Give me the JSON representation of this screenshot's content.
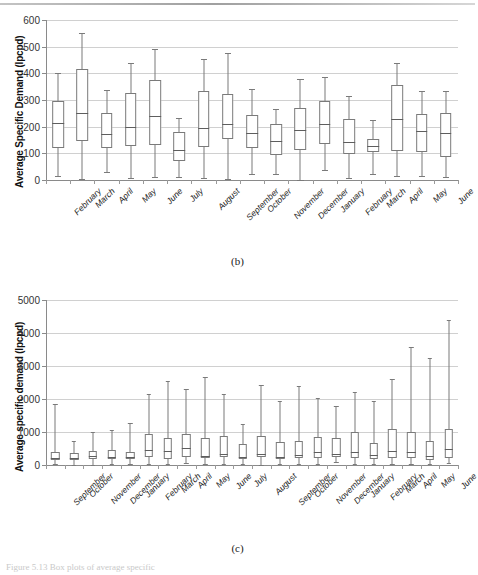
{
  "document": {
    "page_caption": "Figure 5.13 Box plots of average specific",
    "panel_b_label": "(b)",
    "panel_c_label": "(c)"
  },
  "chart_data": [
    {
      "id": "panel-b",
      "type": "box",
      "title": "",
      "panel": "(b)",
      "xlabel": "",
      "ylabel": "Average Specific Demand (lpcpd)",
      "ylim": [
        0,
        600
      ],
      "yticks": [
        0,
        100,
        200,
        300,
        400,
        500,
        600
      ],
      "grid": true,
      "legend": "none",
      "categories": [
        "February",
        "March",
        "April",
        "May",
        "June",
        "July",
        "August",
        "September",
        "October",
        "November",
        "December",
        "January",
        "February",
        "March",
        "April",
        "May",
        "June"
      ],
      "boxes": [
        {
          "category": "February",
          "min": 15,
          "q1": 120,
          "median": 212,
          "q3": 295,
          "max": 400
        },
        {
          "category": "March",
          "min": 5,
          "q1": 148,
          "median": 250,
          "q3": 418,
          "max": 553
        },
        {
          "category": "April",
          "min": 30,
          "q1": 120,
          "median": 174,
          "q3": 250,
          "max": 338
        },
        {
          "category": "May",
          "min": 8,
          "q1": 128,
          "median": 197,
          "q3": 326,
          "max": 440
        },
        {
          "category": "June",
          "min": 12,
          "q1": 130,
          "median": 241,
          "q3": 374,
          "max": 492
        },
        {
          "category": "July",
          "min": 10,
          "q1": 72,
          "median": 111,
          "q3": 180,
          "max": 234
        },
        {
          "category": "August",
          "min": 8,
          "q1": 125,
          "median": 195,
          "q3": 335,
          "max": 452
        },
        {
          "category": "September",
          "min": 2,
          "q1": 152,
          "median": 210,
          "q3": 321,
          "max": 476
        },
        {
          "category": "October",
          "min": 24,
          "q1": 120,
          "median": 175,
          "q3": 245,
          "max": 340
        },
        {
          "category": "November",
          "min": 22,
          "q1": 93,
          "median": 147,
          "q3": 210,
          "max": 265
        },
        {
          "category": "December",
          "min": 0,
          "q1": 112,
          "median": 186,
          "q3": 270,
          "max": 378
        },
        {
          "category": "January",
          "min": 38,
          "q1": 135,
          "median": 210,
          "q3": 295,
          "max": 386
        },
        {
          "category": "February",
          "min": 8,
          "q1": 96,
          "median": 143,
          "q3": 228,
          "max": 316
        },
        {
          "category": "March",
          "min": 24,
          "q1": 106,
          "median": 127,
          "q3": 155,
          "max": 226
        },
        {
          "category": "April",
          "min": 14,
          "q1": 110,
          "median": 228,
          "q3": 357,
          "max": 438
        },
        {
          "category": "May",
          "min": 14,
          "q1": 106,
          "median": 185,
          "q3": 246,
          "max": 333
        },
        {
          "category": "June",
          "min": 10,
          "q1": 88,
          "median": 176,
          "q3": 250,
          "max": 332
        }
      ]
    },
    {
      "id": "panel-c",
      "type": "box",
      "title": "",
      "panel": "(c)",
      "xlabel": "",
      "ylabel": "Average specific demand (lpcpd)",
      "ylim": [
        0,
        5000
      ],
      "yticks": [
        0,
        1000,
        2000,
        3000,
        4000,
        5000
      ],
      "grid": true,
      "legend": "none",
      "categories": [
        "September",
        "October",
        "November",
        "December",
        "January",
        "February",
        "March",
        "April",
        "May",
        "June",
        "July",
        "August",
        "September",
        "October",
        "November",
        "December",
        "January",
        "February",
        "March",
        "April",
        "May",
        "June"
      ],
      "boxes": [
        {
          "category": "September",
          "min": 20,
          "q1": 150,
          "median": 220,
          "q3": 390,
          "max": 1855
        },
        {
          "category": "October",
          "min": 15,
          "q1": 150,
          "median": 215,
          "q3": 355,
          "max": 735
        },
        {
          "category": "November",
          "min": 10,
          "q1": 175,
          "median": 262,
          "q3": 430,
          "max": 985
        },
        {
          "category": "December",
          "min": 25,
          "q1": 180,
          "median": 255,
          "q3": 460,
          "max": 1065
        },
        {
          "category": "January",
          "min": 30,
          "q1": 170,
          "median": 250,
          "q3": 395,
          "max": 1265
        },
        {
          "category": "February",
          "min": 20,
          "q1": 255,
          "median": 455,
          "q3": 925,
          "max": 2160
        },
        {
          "category": "March",
          "min": 45,
          "q1": 195,
          "median": 415,
          "q3": 815,
          "max": 2540
        },
        {
          "category": "April",
          "min": 60,
          "q1": 250,
          "median": 520,
          "q3": 940,
          "max": 2305
        },
        {
          "category": "May",
          "min": 25,
          "q1": 205,
          "median": 285,
          "q3": 820,
          "max": 2680
        },
        {
          "category": "June",
          "min": 25,
          "q1": 230,
          "median": 330,
          "q3": 885,
          "max": 2145
        },
        {
          "category": "July",
          "min": 40,
          "q1": 175,
          "median": 240,
          "q3": 650,
          "max": 1245
        },
        {
          "category": "August",
          "min": 15,
          "q1": 230,
          "median": 340,
          "q3": 880,
          "max": 2410
        },
        {
          "category": "September",
          "min": 20,
          "q1": 175,
          "median": 255,
          "q3": 690,
          "max": 1950
        },
        {
          "category": "October",
          "min": 20,
          "q1": 215,
          "median": 305,
          "q3": 720,
          "max": 2390
        },
        {
          "category": "November",
          "min": 25,
          "q1": 200,
          "median": 390,
          "q3": 860,
          "max": 2040
        },
        {
          "category": "December",
          "min": 95,
          "q1": 230,
          "median": 340,
          "q3": 810,
          "max": 1800
        },
        {
          "category": "January",
          "min": 30,
          "q1": 215,
          "median": 390,
          "q3": 1010,
          "max": 2215
        },
        {
          "category": "February",
          "min": 35,
          "q1": 190,
          "median": 305,
          "q3": 670,
          "max": 1935
        },
        {
          "category": "March",
          "min": 30,
          "q1": 215,
          "median": 425,
          "q3": 1100,
          "max": 2605
        },
        {
          "category": "April",
          "min": 25,
          "q1": 205,
          "median": 385,
          "q3": 1015,
          "max": 3570
        },
        {
          "category": "May",
          "min": 30,
          "q1": 160,
          "median": 285,
          "q3": 720,
          "max": 3255
        },
        {
          "category": "June",
          "min": 70,
          "q1": 225,
          "median": 470,
          "q3": 1080,
          "max": 4380
        }
      ]
    }
  ]
}
